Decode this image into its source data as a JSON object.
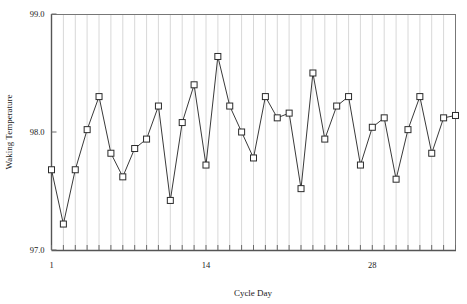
{
  "chart_data": {
    "type": "line",
    "title": "",
    "xlabel": "Cycle Day",
    "ylabel": "Waking Temperature",
    "xlim": [
      1,
      35
    ],
    "ylim": [
      97.0,
      99.0
    ],
    "grid": "vertical",
    "legend": "none",
    "marker": "open-square",
    "line_color": "#3a3a3a",
    "marker_fill": "#ffffff",
    "marker_edge": "#2b2b2b",
    "grid_color": "#d8d8d8",
    "axis_color": "#555555",
    "x": [
      1,
      2,
      3,
      4,
      5,
      6,
      7,
      8,
      9,
      10,
      11,
      12,
      13,
      14,
      15,
      16,
      17,
      18,
      19,
      20,
      21,
      22,
      23,
      24,
      25,
      26,
      27,
      28,
      29,
      30,
      31,
      32,
      33,
      34,
      35
    ],
    "values": [
      97.68,
      97.22,
      97.68,
      98.02,
      98.3,
      97.82,
      97.62,
      97.86,
      97.94,
      98.22,
      97.42,
      98.08,
      98.4,
      97.72,
      98.64,
      98.22,
      98.0,
      97.78,
      98.3,
      98.12,
      98.16,
      97.52,
      98.5,
      97.94,
      98.22,
      98.3,
      97.72,
      98.04,
      98.12,
      97.6,
      98.02,
      98.3,
      97.82,
      98.12,
      98.14
    ],
    "xticks": [
      1,
      14,
      28
    ],
    "xtick_labels": [
      "1",
      "14",
      "28"
    ],
    "yticks": [
      97.0,
      98.0,
      99.0
    ],
    "ytick_labels": [
      "97.0",
      "98.0",
      "99.0"
    ]
  }
}
